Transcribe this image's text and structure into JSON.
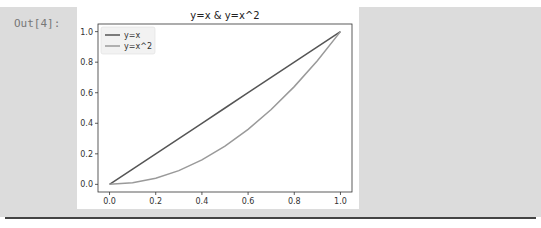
{
  "cell": {
    "prompt": "Out[4]:"
  },
  "chart_data": {
    "type": "line",
    "title": "y=x & y=x^2",
    "xlabel": "",
    "ylabel": "",
    "xlim": [
      -0.05,
      1.05
    ],
    "ylim": [
      -0.05,
      1.05
    ],
    "x_ticks": [
      0.0,
      0.2,
      0.4,
      0.6,
      0.8,
      1.0
    ],
    "x_tick_labels": [
      "0.0",
      "0.2",
      "0.4",
      "0.6",
      "0.8",
      "1.0"
    ],
    "y_ticks": [
      0.0,
      0.2,
      0.4,
      0.6,
      0.8,
      1.0
    ],
    "y_tick_labels": [
      "0.0",
      "0.2",
      "0.4",
      "0.6",
      "0.8",
      "1.0"
    ],
    "grid": false,
    "legend_position": "top-left",
    "x": [
      0.0,
      0.1,
      0.2,
      0.3,
      0.4,
      0.5,
      0.6,
      0.7,
      0.8,
      0.9,
      1.0
    ],
    "series": [
      {
        "name": "y=x",
        "color": "#555555",
        "values": [
          0.0,
          0.1,
          0.2,
          0.3,
          0.4,
          0.5,
          0.6,
          0.7,
          0.8,
          0.9,
          1.0
        ]
      },
      {
        "name": "y=x^2",
        "color": "#9a9a9a",
        "values": [
          0.0,
          0.01,
          0.04,
          0.09,
          0.16,
          0.25,
          0.36,
          0.49,
          0.64,
          0.81,
          1.0
        ]
      }
    ]
  }
}
